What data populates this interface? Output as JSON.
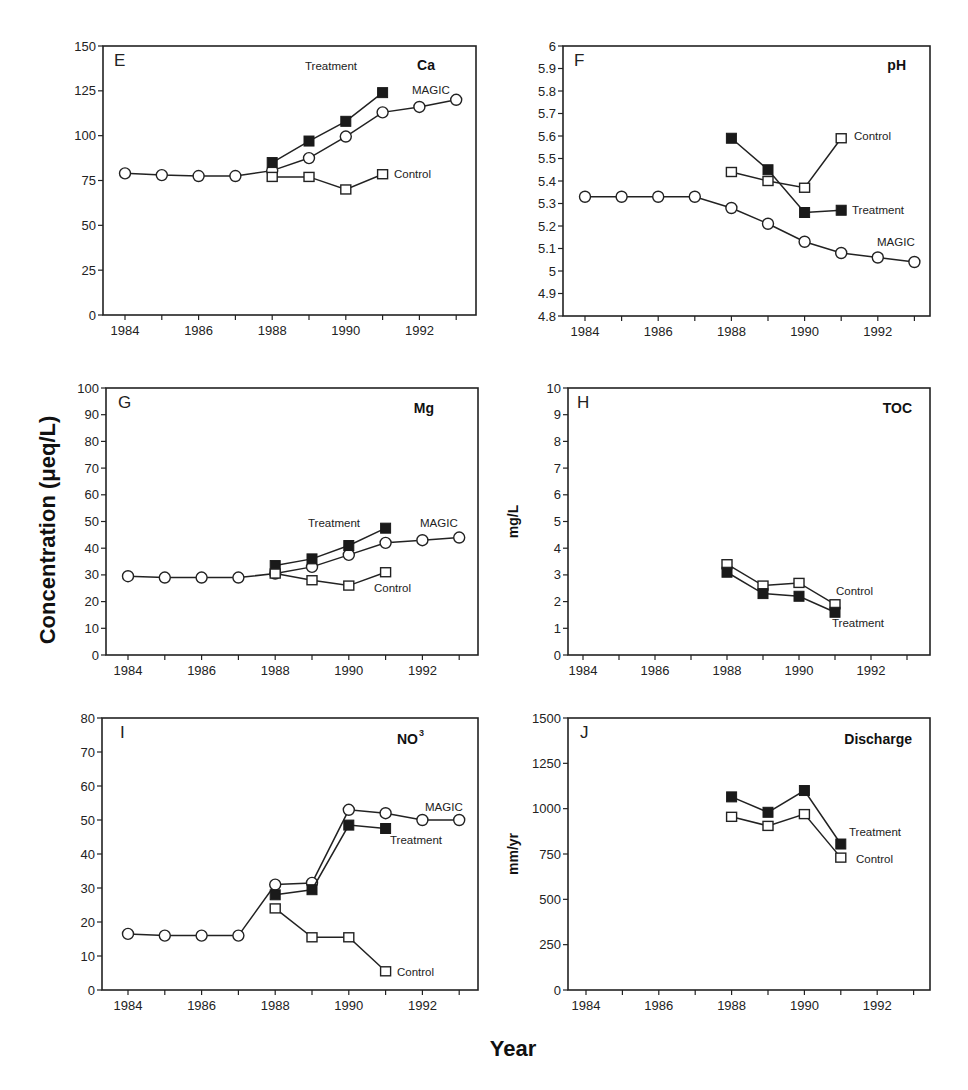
{
  "figure": {
    "shared_ylabel": "Concentration (μeq/L)",
    "shared_xlabel": "Year"
  },
  "chart_data": [
    {
      "type": "line",
      "panel": "E",
      "title": "Ca",
      "x_ticks": [
        1984,
        1986,
        1988,
        1990,
        1992
      ],
      "ylim": [
        0,
        150
      ],
      "yticks": [
        0,
        25,
        50,
        75,
        100,
        125,
        150
      ],
      "ylabel": "",
      "series": [
        {
          "name": "MAGIC",
          "marker": "open-circle",
          "x": [
            1984,
            1985,
            1986,
            1987,
            1988,
            1989,
            1990,
            1991,
            1992,
            1993
          ],
          "values": [
            79,
            78,
            77.5,
            77.5,
            80.5,
            87.5,
            99.5,
            113,
            116,
            120
          ]
        },
        {
          "name": "Treatment",
          "marker": "filled-square",
          "x": [
            1988,
            1989,
            1990,
            1991
          ],
          "values": [
            85,
            97,
            108,
            124
          ]
        },
        {
          "name": "Control",
          "marker": "open-square",
          "x": [
            1988,
            1989,
            1990,
            1991
          ],
          "values": [
            77,
            77,
            70,
            78.5
          ]
        }
      ]
    },
    {
      "type": "line",
      "panel": "F",
      "title": "pH",
      "x_ticks": [
        1984,
        1986,
        1988,
        1990,
        1992
      ],
      "ylim": [
        4.8,
        6
      ],
      "yticks": [
        4.8,
        4.9,
        5,
        5.1,
        5.2,
        5.3,
        5.4,
        5.5,
        5.6,
        5.7,
        5.8,
        5.9,
        6
      ],
      "ylabel": "",
      "series": [
        {
          "name": "MAGIC",
          "marker": "open-circle",
          "x": [
            1984,
            1985,
            1986,
            1987,
            1988,
            1989,
            1990,
            1991,
            1992,
            1993
          ],
          "values": [
            5.33,
            5.33,
            5.33,
            5.33,
            5.28,
            5.21,
            5.13,
            5.08,
            5.06,
            5.04
          ]
        },
        {
          "name": "Treatment",
          "marker": "filled-square",
          "x": [
            1988,
            1989,
            1990,
            1991
          ],
          "values": [
            5.59,
            5.45,
            5.26,
            5.27
          ]
        },
        {
          "name": "Control",
          "marker": "open-square",
          "x": [
            1988,
            1989,
            1990,
            1991
          ],
          "values": [
            5.44,
            5.4,
            5.37,
            5.59
          ]
        }
      ]
    },
    {
      "type": "line",
      "panel": "G",
      "title": "Mg",
      "x_ticks": [
        1984,
        1986,
        1988,
        1990,
        1992
      ],
      "ylim": [
        0,
        100
      ],
      "yticks": [
        0,
        10,
        20,
        30,
        40,
        50,
        60,
        70,
        80,
        90,
        100
      ],
      "ylabel": "",
      "series": [
        {
          "name": "MAGIC",
          "marker": "open-circle",
          "x": [
            1984,
            1985,
            1986,
            1987,
            1988,
            1989,
            1990,
            1991,
            1992,
            1993
          ],
          "values": [
            29.5,
            29,
            29,
            29,
            30.5,
            33,
            37.5,
            42,
            43,
            44
          ]
        },
        {
          "name": "Treatment",
          "marker": "filled-square",
          "x": [
            1988,
            1989,
            1990,
            1991
          ],
          "values": [
            33.5,
            36,
            41,
            47.5
          ]
        },
        {
          "name": "Control",
          "marker": "open-square",
          "x": [
            1988,
            1989,
            1990,
            1991
          ],
          "values": [
            30.5,
            28,
            26,
            31
          ]
        }
      ]
    },
    {
      "type": "line",
      "panel": "H",
      "title": "TOC",
      "x_ticks": [
        1984,
        1986,
        1988,
        1990,
        1992
      ],
      "ylim": [
        0,
        10
      ],
      "yticks": [
        0,
        1,
        2,
        3,
        4,
        5,
        6,
        7,
        8,
        9,
        10
      ],
      "ylabel": "mg/L",
      "series": [
        {
          "name": "Control",
          "marker": "open-square",
          "x": [
            1988,
            1989,
            1990,
            1991
          ],
          "values": [
            3.4,
            2.6,
            2.7,
            1.9
          ]
        },
        {
          "name": "Treatment",
          "marker": "filled-square",
          "x": [
            1988,
            1989,
            1990,
            1991
          ],
          "values": [
            3.1,
            2.3,
            2.2,
            1.6
          ]
        }
      ]
    },
    {
      "type": "line",
      "panel": "I",
      "title": "NO3",
      "x_ticks": [
        1984,
        1986,
        1988,
        1990,
        1992
      ],
      "ylim": [
        0,
        80
      ],
      "yticks": [
        0,
        10,
        20,
        30,
        40,
        50,
        60,
        70,
        80
      ],
      "ylabel": "",
      "series": [
        {
          "name": "MAGIC",
          "marker": "open-circle",
          "x": [
            1984,
            1985,
            1986,
            1987,
            1988,
            1989,
            1990,
            1991,
            1992,
            1993
          ],
          "values": [
            16.5,
            16,
            16,
            16,
            31,
            31.5,
            53,
            52,
            50,
            50
          ]
        },
        {
          "name": "Treatment",
          "marker": "filled-square",
          "x": [
            1988,
            1989,
            1990,
            1991
          ],
          "values": [
            28,
            29.5,
            48.5,
            47.5
          ]
        },
        {
          "name": "Control",
          "marker": "open-square",
          "x": [
            1988,
            1989,
            1990,
            1991
          ],
          "values": [
            24,
            15.5,
            15.5,
            5.5
          ]
        }
      ]
    },
    {
      "type": "line",
      "panel": "J",
      "title": "Discharge",
      "x_ticks": [
        1984,
        1986,
        1988,
        1990,
        1992
      ],
      "ylim": [
        0,
        1500
      ],
      "yticks": [
        0,
        250,
        500,
        750,
        1000,
        1250,
        1500
      ],
      "ylabel": "mm/yr",
      "series": [
        {
          "name": "Treatment",
          "marker": "filled-square",
          "x": [
            1988,
            1989,
            1990,
            1991
          ],
          "values": [
            1065,
            980,
            1100,
            805
          ]
        },
        {
          "name": "Control",
          "marker": "open-square",
          "x": [
            1988,
            1989,
            1990,
            1991
          ],
          "values": [
            955,
            905,
            970,
            730
          ]
        }
      ]
    }
  ],
  "panels": {
    "E": {
      "letter": "E",
      "title": "Ca",
      "labels": {
        "treatment": "Treatment",
        "magic": "MAGIC",
        "control": "Control"
      }
    },
    "F": {
      "letter": "F",
      "title": "pH",
      "labels": {
        "treatment": "Treatment",
        "magic": "MAGIC",
        "control": "Control"
      }
    },
    "G": {
      "letter": "G",
      "title": "Mg",
      "labels": {
        "treatment": "Treatment",
        "magic": "MAGIC",
        "control": "Control"
      }
    },
    "H": {
      "letter": "H",
      "title": "TOC",
      "ylabel": "mg/L",
      "labels": {
        "treatment": "Treatment",
        "control": "Control"
      }
    },
    "I": {
      "letter": "I",
      "title": "NO",
      "title_sup": "3",
      "labels": {
        "treatment": "Treatment",
        "magic": "MAGIC",
        "control": "Control"
      }
    },
    "J": {
      "letter": "J",
      "title": "Discharge",
      "ylabel": "mm/yr",
      "labels": {
        "treatment": "Treatment",
        "control": "Control"
      }
    }
  }
}
